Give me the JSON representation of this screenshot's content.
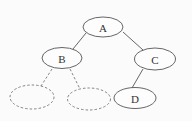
{
  "diagram": {
    "type": "binary-tree",
    "stroke_color": "#555555",
    "dashed_color": "#777777",
    "nodes": [
      {
        "id": "A",
        "label": "A",
        "cx": 103,
        "cy": 27,
        "rx": 20,
        "ry": 10,
        "style": "solid"
      },
      {
        "id": "B",
        "label": "B",
        "cx": 62,
        "cy": 58,
        "rx": 20,
        "ry": 10.5,
        "style": "solid"
      },
      {
        "id": "C",
        "label": "C",
        "cx": 155,
        "cy": 59,
        "rx": 20.5,
        "ry": 11,
        "style": "solid"
      },
      {
        "id": "D",
        "label": "D",
        "cx": 135,
        "cy": 98,
        "rx": 21,
        "ry": 10.5,
        "style": "solid"
      },
      {
        "id": "B-left",
        "label": "",
        "cx": 32,
        "cy": 97,
        "rx": 22,
        "ry": 12,
        "style": "dashed"
      },
      {
        "id": "B-right",
        "label": "",
        "cx": 89,
        "cy": 99,
        "rx": 21.5,
        "ry": 11,
        "style": "dashed"
      }
    ],
    "edges": [
      {
        "from": "A",
        "to": "B",
        "style": "solid"
      },
      {
        "from": "A",
        "to": "C",
        "style": "solid"
      },
      {
        "from": "C",
        "to": "D",
        "style": "solid"
      },
      {
        "from": "B",
        "to": "B-left",
        "style": "dashed"
      },
      {
        "from": "B",
        "to": "B-right",
        "style": "dashed"
      }
    ]
  }
}
